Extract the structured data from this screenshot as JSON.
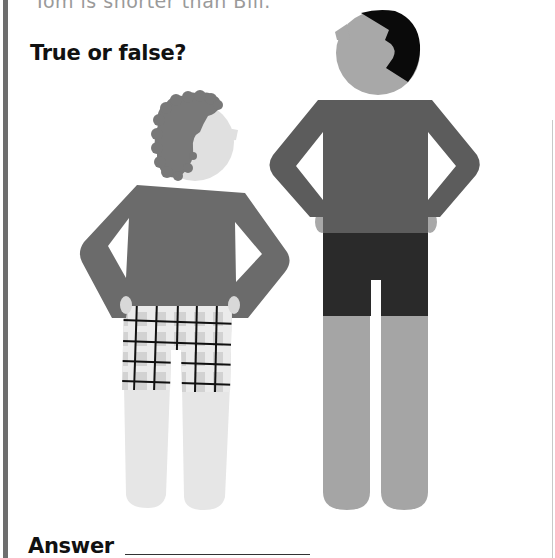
{
  "question": {
    "statement_partial": "Tom is shorter than Bill.",
    "heading": "True or false?"
  },
  "answer": {
    "label": "Answer",
    "value": ""
  },
  "figures": [
    {
      "name": "short-man",
      "description": "Short man with curly hair, arms akimbo, plaid shorts",
      "colors": {
        "head": "#e0e0e0",
        "hair": "#787878",
        "shirt": "#6b6b6b",
        "shorts": "#d6d6d6",
        "plaid_lines": "#111111",
        "legs": "#e6e6e6"
      }
    },
    {
      "name": "tall-man",
      "description": "Tall man with black hair, arms akimbo, dark shorts",
      "colors": {
        "head": "#a8a8a8",
        "hair": "#0a0a0a",
        "shirt": "#5c5c5c",
        "shorts": "#2a2a2a",
        "legs": "#a5a5a5",
        "hands": "#a8a8a8"
      }
    }
  ]
}
